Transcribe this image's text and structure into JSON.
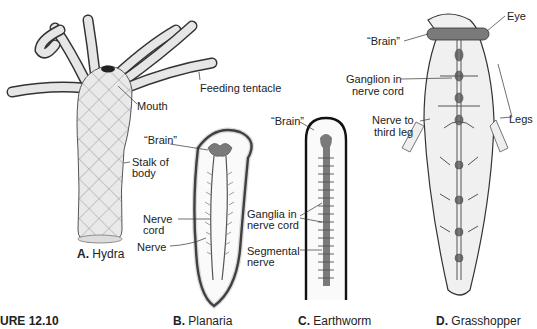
{
  "figure": {
    "number_label": "URE 12.10"
  },
  "panels": [
    {
      "id": "A",
      "letter": "A.",
      "name": "Hydra",
      "labels": [
        "Mouth",
        "Feeding tentacle",
        "Stalk of",
        "body"
      ]
    },
    {
      "id": "B",
      "letter": "B.",
      "name": "Planaria",
      "labels": [
        "“Brain”",
        "Nerve",
        "cord",
        "Nerve"
      ]
    },
    {
      "id": "C",
      "letter": "C.",
      "name": "Earthworm",
      "labels": [
        "“Brain”",
        "Ganglia in",
        "nerve cord",
        "Segmental",
        "nerve"
      ]
    },
    {
      "id": "D",
      "letter": "D.",
      "name": "Grasshopper",
      "labels": [
        "Eye",
        "“Brain”",
        "Ganglion in",
        "nerve cord",
        "Nerve to",
        "third leg",
        "Legs"
      ]
    }
  ],
  "colors": {
    "outline": "#1a1a1a",
    "nerve_fill": "#7a7a7a",
    "body_fill": "#efefef",
    "stipple": "#9a9a9a"
  }
}
